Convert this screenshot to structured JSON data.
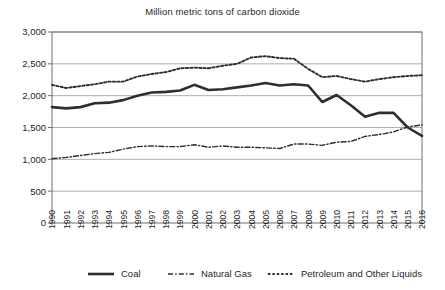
{
  "chart_data": {
    "type": "line",
    "title": "Million metric tons of carbon dioxide",
    "subtitle": "",
    "xlabel": "",
    "ylabel": "",
    "grid": true,
    "legend_position": "bottom",
    "ylim": [
      0,
      3000
    ],
    "ytick_labels": [
      "3,000",
      "2,500",
      "2,000",
      "1,500",
      "1,000",
      "500",
      "0"
    ],
    "ytick_values": [
      3000,
      2500,
      2000,
      1500,
      1000,
      500,
      0
    ],
    "x": [
      1990,
      1991,
      1992,
      1993,
      1994,
      1995,
      1996,
      1997,
      1998,
      1999,
      2000,
      2001,
      2002,
      2003,
      2004,
      2005,
      2006,
      2007,
      2008,
      2009,
      2010,
      2011,
      2012,
      2013,
      2014,
      2015,
      2016
    ],
    "categories": [
      "1990",
      "1991",
      "1992",
      "1993",
      "1994",
      "1995",
      "1996",
      "1997",
      "1998",
      "1999",
      "2000",
      "2001",
      "2002",
      "2003",
      "2004",
      "2005",
      "2006",
      "2007",
      "2008",
      "2009",
      "2010",
      "2011",
      "2012",
      "2013",
      "2014",
      "2015",
      "2016"
    ],
    "series": [
      {
        "name": "Coal",
        "style": "solid-thick",
        "color": "#2e2e2e",
        "values": [
          1820,
          1800,
          1820,
          1880,
          1890,
          1930,
          2000,
          2050,
          2060,
          2080,
          2170,
          2090,
          2100,
          2130,
          2160,
          2200,
          2160,
          2180,
          2160,
          1900,
          2010,
          1850,
          1670,
          1730,
          1730,
          1500,
          1370
        ]
      },
      {
        "name": "Natural Gas",
        "style": "dash-dot",
        "color": "#2e2e2e",
        "values": [
          1010,
          1030,
          1060,
          1090,
          1110,
          1160,
          1200,
          1210,
          1200,
          1200,
          1230,
          1190,
          1210,
          1190,
          1190,
          1180,
          1170,
          1240,
          1240,
          1220,
          1270,
          1280,
          1360,
          1390,
          1430,
          1510,
          1540
        ]
      },
      {
        "name": "Petroleum and Other Liquids",
        "style": "dotted",
        "color": "#2e2e2e",
        "values": [
          2170,
          2120,
          2150,
          2180,
          2220,
          2220,
          2300,
          2340,
          2370,
          2430,
          2440,
          2430,
          2470,
          2500,
          2600,
          2620,
          2590,
          2580,
          2420,
          2290,
          2310,
          2260,
          2220,
          2260,
          2290,
          2310,
          2320
        ]
      }
    ],
    "legend": [
      {
        "label": "Coal",
        "style": "solid-thick"
      },
      {
        "label": "Natural Gas",
        "style": "dash-dot"
      },
      {
        "label": "Petroleum and Other Liquids",
        "style": "dotted"
      }
    ]
  }
}
